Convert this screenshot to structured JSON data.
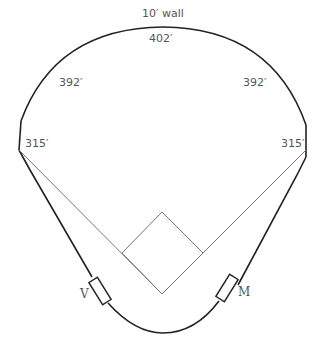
{
  "diagram": {
    "type": "baseball-field-dimensions",
    "labels": {
      "wall_note": "10′ wall",
      "center_field": "402′",
      "left_center": "392′",
      "right_center": "392′",
      "left_field_line": "315′",
      "right_field_line": "315′",
      "visitor_dugout": "V",
      "home_dugout": "M"
    },
    "colors": {
      "wall": "#222222",
      "foul_lines": "#777777",
      "text": "#555555"
    }
  }
}
